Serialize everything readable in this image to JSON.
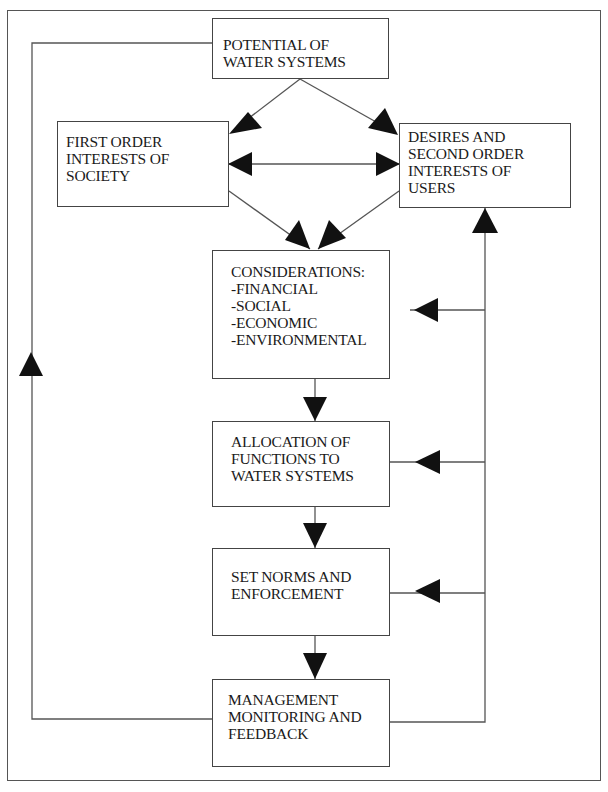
{
  "diagram": {
    "type": "flowchart",
    "colors": {
      "line": "#555555",
      "arrowhead": "#111111",
      "box_border": "#444444",
      "background": "#ffffff"
    },
    "nodes": [
      {
        "id": "potential",
        "lines": [
          "POTENTIAL OF",
          "WATER SYSTEMS"
        ]
      },
      {
        "id": "first_order",
        "lines": [
          "FIRST ORDER",
          "INTERESTS OF",
          "SOCIETY"
        ]
      },
      {
        "id": "desires",
        "lines": [
          "DESIRES AND",
          "SECOND ORDER",
          "INTERESTS OF",
          "USERS"
        ]
      },
      {
        "id": "considerations",
        "lines": [
          "CONSIDERATIONS:",
          "-FINANCIAL",
          "-SOCIAL",
          "-ECONOMIC",
          "-ENVIRONMENTAL"
        ]
      },
      {
        "id": "allocation",
        "lines": [
          "ALLOCATION OF",
          "FUNCTIONS TO",
          "WATER SYSTEMS"
        ]
      },
      {
        "id": "norms",
        "lines": [
          "SET NORMS AND",
          "ENFORCEMENT"
        ]
      },
      {
        "id": "management",
        "lines": [
          "MANAGEMENT",
          "MONITORING AND",
          "FEEDBACK"
        ]
      }
    ],
    "edges": [
      {
        "from": "potential",
        "to": "first_order"
      },
      {
        "from": "potential",
        "to": "desires"
      },
      {
        "from": "first_order",
        "to": "desires",
        "bidirectional": true
      },
      {
        "from": "first_order",
        "to": "considerations"
      },
      {
        "from": "desires",
        "to": "considerations"
      },
      {
        "from": "considerations",
        "to": "allocation"
      },
      {
        "from": "allocation",
        "to": "norms"
      },
      {
        "from": "norms",
        "to": "management"
      },
      {
        "from": "management",
        "to": "potential",
        "route": "left feedback loop"
      },
      {
        "from": "management",
        "to": "desires",
        "route": "right feedback loop"
      },
      {
        "from": "management",
        "to": "considerations",
        "route": "right feedback branch"
      },
      {
        "from": "management",
        "to": "allocation",
        "route": "right feedback branch"
      },
      {
        "from": "management",
        "to": "norms",
        "route": "right feedback branch"
      }
    ]
  }
}
